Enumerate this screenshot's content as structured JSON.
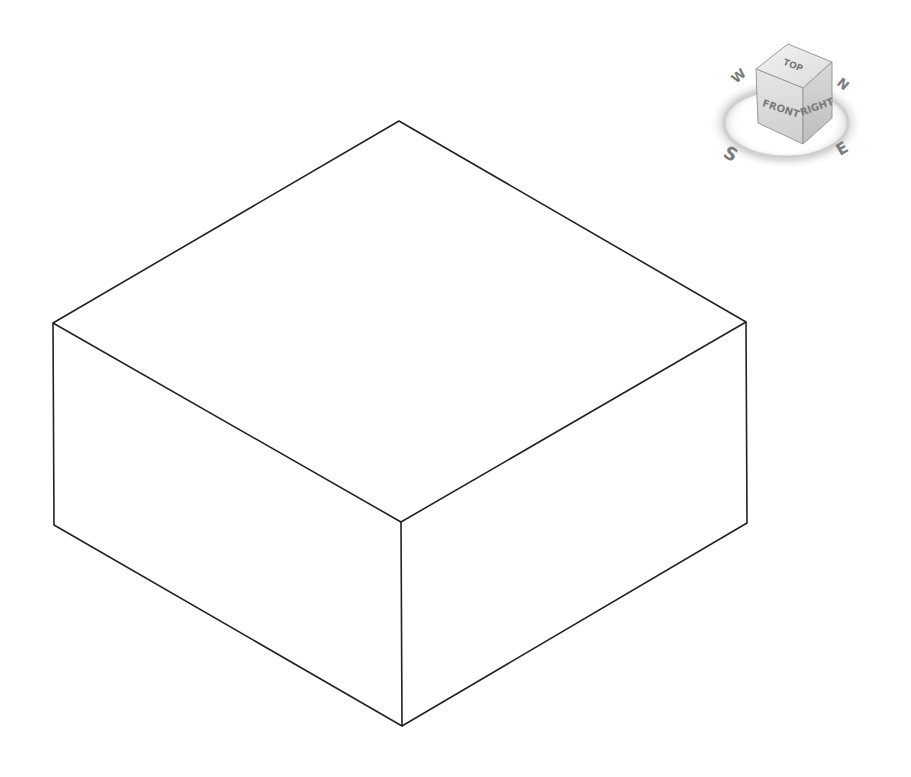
{
  "viewport": {
    "background": "#ffffff",
    "line_color": "#222222",
    "model": {
      "type": "box",
      "vertices": {
        "top_back": [
          399,
          121
        ],
        "top_left": [
          53,
          323
        ],
        "top_right": [
          746,
          322
        ],
        "top_front": [
          401,
          522
        ],
        "bottom_left": [
          54,
          525
        ],
        "bottom_right": [
          747,
          523
        ],
        "bottom_front": [
          402,
          726
        ]
      }
    }
  },
  "viewcube": {
    "faces": {
      "top": "TOP",
      "front": "FRONT",
      "right": "RIGHT"
    },
    "compass": {
      "north": "N",
      "south": "S",
      "east": "E",
      "west": "W"
    }
  }
}
